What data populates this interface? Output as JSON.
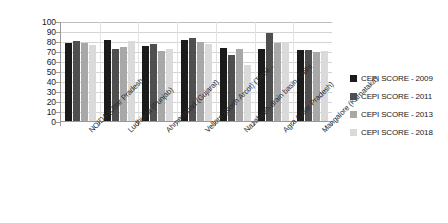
{
  "chart_data": {
    "type": "bar",
    "title": "",
    "xlabel": "",
    "ylabel": "",
    "ylim": [
      0,
      100
    ],
    "ytick_step": 10,
    "yticks": [
      100,
      90,
      80,
      70,
      60,
      50,
      40,
      30,
      20,
      10,
      0
    ],
    "grid": true,
    "legend_position": "right",
    "categories": [
      "NOIDA (Uttar Pradesh",
      "Ludhiana (Punjab)",
      "Ahmedabad (Gujarat)",
      "Vellore (North Arcot) (Tamil...",
      "Nazafgarh drain basin, Delhi",
      "Agra (Uttar Pradesh)",
      "Mangalore (Karnataka)"
    ],
    "series": [
      {
        "name": "CEPI SCORE - 2009",
        "color": "#1b1b1b",
        "values": [
          78,
          81,
          75,
          81,
          73,
          72,
          71
        ]
      },
      {
        "name": "CEPI SCORE - 2011",
        "color": "#4f4f4f",
        "values": [
          80,
          72,
          77,
          83,
          66,
          88,
          71
        ]
      },
      {
        "name": "CEPI SCORE - 2013",
        "color": "#a8a8a8",
        "values": [
          78,
          74,
          70,
          79,
          72,
          78,
          69
        ]
      },
      {
        "name": "CEPI SCORE - 2018",
        "color": "#dadada",
        "values": [
          76,
          80,
          72,
          77,
          56,
          79,
          70
        ]
      }
    ]
  },
  "legend": {
    "items": [
      {
        "label": "CEPI SCORE - 2009",
        "color": "#1b1b1b"
      },
      {
        "label": "CEPI SCORE - 2011",
        "color": "#4f4f4f"
      },
      {
        "label": "CEPI SCORE - 2013",
        "color": "#a8a8a8"
      },
      {
        "label": "CEPI SCORE - 2018",
        "color": "#dadada"
      }
    ]
  }
}
